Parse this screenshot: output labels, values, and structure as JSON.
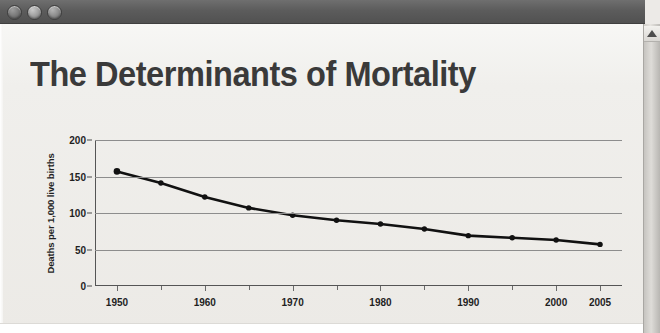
{
  "window": {
    "controls": [
      {
        "name": "close",
        "label": "Close"
      },
      {
        "name": "minimize",
        "label": "Minimize"
      },
      {
        "name": "zoom",
        "label": "Zoom"
      }
    ],
    "scrollbar": {
      "arrow_up": "▲"
    }
  },
  "document": {
    "title": "The Determinants of Mortality"
  },
  "chart_data": {
    "type": "line",
    "title": "",
    "xlabel": "",
    "ylabel": "Deaths per 1,000 live births",
    "x": [
      1950,
      1955,
      1960,
      1965,
      1970,
      1975,
      1980,
      1985,
      1990,
      1995,
      2000,
      2005
    ],
    "values": [
      157,
      141,
      122,
      107,
      97,
      90,
      85,
      78,
      69,
      66,
      63,
      57
    ],
    "series": [
      {
        "name": "Infant mortality",
        "values": [
          157,
          141,
          122,
          107,
          97,
          90,
          85,
          78,
          69,
          66,
          63,
          57
        ]
      }
    ],
    "xlim": [
      1947.5,
      2007.5
    ],
    "ylim": [
      0,
      200
    ],
    "xtick_labels": [
      "1950",
      "1960",
      "1970",
      "1980",
      "1990",
      "2000",
      "2005"
    ],
    "xtick_values": [
      1950,
      1960,
      1970,
      1980,
      1990,
      2000,
      2005
    ],
    "xtick_minor_values": [
      1955,
      1965,
      1975,
      1985,
      1995
    ],
    "ytick_labels": [
      "0",
      "50",
      "100",
      "150",
      "200"
    ],
    "ytick_values": [
      0,
      50,
      100,
      150,
      200
    ],
    "grid": true,
    "grid_axis": "y",
    "legend": "none",
    "line_color": "#111111",
    "marker": "circle",
    "marker_color": "#111111"
  },
  "colors": {
    "titlebar": "#5c5c5c",
    "page_background": "#eceae7",
    "title_text": "#3a3a3a",
    "axis": "#555555",
    "gridline": "#8d8d8d"
  }
}
